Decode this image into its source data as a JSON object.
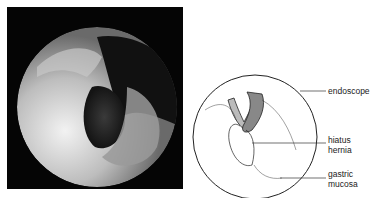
{
  "figure": {
    "photo": {
      "description": "endoscopic retroflexed view",
      "icon": "endoscopy-photo"
    },
    "drawing": {
      "description": "line drawing of endoscopic view",
      "icon": "endoscopy-illustration"
    },
    "labels": [
      {
        "line1": "endoscope",
        "line2": ""
      },
      {
        "line1": "hiatus",
        "line2": "hernia"
      },
      {
        "line1": "gastric",
        "line2": "mucosa"
      }
    ]
  }
}
